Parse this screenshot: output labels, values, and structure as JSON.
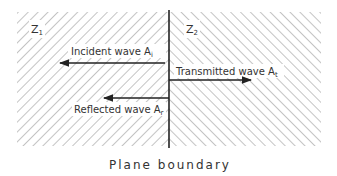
{
  "diagram": {
    "caption": "Plane boundary",
    "medium_left": {
      "label": "Z",
      "subscript": "1"
    },
    "medium_right": {
      "label": "Z",
      "subscript": "2"
    },
    "waves": {
      "incident": {
        "text": "Incident wave A",
        "subscript": "i",
        "direction": "left"
      },
      "transmitted": {
        "text": "Transmitted wave A",
        "subscript": "t",
        "direction": "right"
      },
      "reflected": {
        "text": "Reflected wave A",
        "subscript": "r",
        "direction": "left"
      }
    },
    "colors": {
      "ink": "#222222",
      "hatch": "#8a8a8a",
      "background": "#ffffff"
    }
  }
}
